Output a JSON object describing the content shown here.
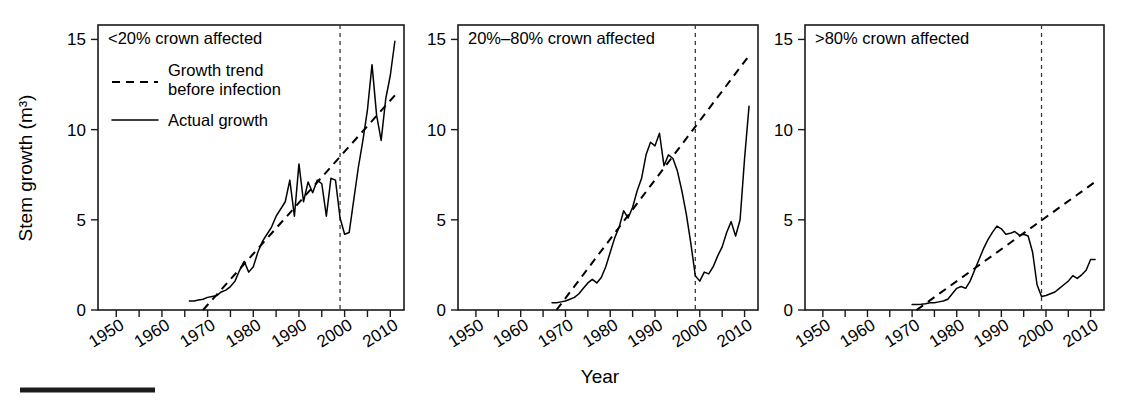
{
  "figure": {
    "width": 1129,
    "height": 404,
    "background": "#ffffff",
    "ylabel": "Stem growth (m³)",
    "xlabel": "Year",
    "footer_rule": true
  },
  "legend": {
    "position": "inside-panel-1-top-left",
    "entries": [
      {
        "style": "dashed",
        "label_line1": "Growth trend",
        "label_line2": "before infection"
      },
      {
        "style": "solid",
        "label_line1": "Actual growth",
        "label_line2": ""
      }
    ]
  },
  "chart_data": [
    {
      "type": "line",
      "title": "<20% crown affected",
      "panel_index": 0,
      "xlabel": "Year",
      "ylabel": "Stem growth (m³)",
      "xlim": [
        1946,
        2013
      ],
      "ylim": [
        0,
        15.8
      ],
      "yticks": [
        0,
        5,
        10,
        15
      ],
      "xticks_major": [
        1950,
        1960,
        1970,
        1980,
        1990,
        2000,
        2010
      ],
      "xticks_minor": [
        1955,
        1965,
        1975,
        1985,
        1995,
        2005
      ],
      "grid": false,
      "infection_year": 1999,
      "annotations": [
        {
          "type": "vline",
          "x": 1999,
          "style": "dashed"
        }
      ],
      "series": [
        {
          "name": "Actual growth",
          "style": "solid",
          "x": [
            1966,
            1967,
            1968,
            1969,
            1970,
            1971,
            1972,
            1973,
            1974,
            1975,
            1976,
            1977,
            1978,
            1979,
            1980,
            1981,
            1982,
            1983,
            1984,
            1985,
            1986,
            1987,
            1988,
            1989,
            1990,
            1991,
            1992,
            1993,
            1994,
            1995,
            1996,
            1997,
            1998,
            1999,
            2000,
            2001,
            2002,
            2003,
            2004,
            2005,
            2006,
            2007,
            2008,
            2009,
            2010,
            2011
          ],
          "values": [
            0.5,
            0.5,
            0.55,
            0.6,
            0.7,
            0.75,
            0.8,
            1.0,
            1.1,
            1.3,
            1.6,
            2.2,
            2.7,
            2.1,
            2.4,
            3.2,
            3.8,
            4.2,
            4.6,
            5.2,
            5.6,
            6.0,
            7.2,
            5.2,
            8.1,
            6.0,
            7.1,
            6.5,
            7.2,
            7.0,
            5.2,
            7.3,
            7.2,
            5.1,
            4.2,
            4.3,
            6.1,
            7.9,
            9.4,
            11.1,
            13.6,
            10.8,
            9.4,
            11.7,
            13.0,
            14.9
          ]
        },
        {
          "name": "Growth trend before infection",
          "style": "dashed",
          "x": [
            1969,
            2011
          ],
          "values": [
            0.0,
            11.9
          ]
        }
      ]
    },
    {
      "type": "line",
      "title": "20%–80% crown affected",
      "panel_index": 1,
      "xlabel": "Year",
      "ylabel": "Stem growth (m³)",
      "xlim": [
        1946,
        2013
      ],
      "ylim": [
        0,
        15.8
      ],
      "yticks": [
        0,
        5,
        10,
        15
      ],
      "xticks_major": [
        1950,
        1960,
        1970,
        1980,
        1990,
        2000,
        2010
      ],
      "xticks_minor": [
        1955,
        1965,
        1975,
        1985,
        1995,
        2005
      ],
      "grid": false,
      "infection_year": 1999,
      "annotations": [
        {
          "type": "vline",
          "x": 1999,
          "style": "dashed"
        }
      ],
      "series": [
        {
          "name": "Actual growth",
          "style": "solid",
          "x": [
            1967,
            1968,
            1969,
            1970,
            1971,
            1972,
            1973,
            1974,
            1975,
            1976,
            1977,
            1978,
            1979,
            1980,
            1981,
            1982,
            1983,
            1984,
            1985,
            1986,
            1987,
            1988,
            1989,
            1990,
            1991,
            1992,
            1993,
            1994,
            1995,
            1996,
            1997,
            1998,
            1999,
            2000,
            2001,
            2002,
            2003,
            2004,
            2005,
            2006,
            2007,
            2008,
            2009,
            2010,
            2011
          ],
          "values": [
            0.4,
            0.4,
            0.45,
            0.5,
            0.6,
            0.7,
            0.9,
            1.2,
            1.5,
            1.7,
            1.5,
            1.8,
            2.4,
            3.2,
            4.0,
            4.6,
            5.5,
            5.1,
            5.7,
            6.6,
            7.3,
            8.6,
            9.3,
            9.1,
            9.8,
            8.0,
            8.6,
            8.4,
            7.7,
            6.6,
            5.3,
            3.7,
            1.9,
            1.6,
            2.1,
            2.0,
            2.4,
            3.0,
            3.5,
            4.3,
            4.9,
            4.1,
            5.0,
            8.4,
            11.3
          ]
        },
        {
          "name": "Growth trend before infection",
          "style": "dashed",
          "x": [
            1968,
            2011
          ],
          "values": [
            0.0,
            14.1
          ]
        }
      ]
    },
    {
      "type": "line",
      "title": ">80% crown affected",
      "panel_index": 2,
      "xlabel": "Year",
      "ylabel": "Stem growth (m³)",
      "xlim": [
        1946,
        2013
      ],
      "ylim": [
        0,
        15.8
      ],
      "yticks": [
        0,
        5,
        10,
        15
      ],
      "xticks_major": [
        1950,
        1960,
        1970,
        1980,
        1990,
        2000,
        2010
      ],
      "xticks_minor": [
        1955,
        1965,
        1975,
        1985,
        1995,
        2005
      ],
      "grid": false,
      "infection_year": 1999,
      "annotations": [
        {
          "type": "vline",
          "x": 1999,
          "style": "dashed"
        }
      ],
      "series": [
        {
          "name": "Actual growth",
          "style": "solid",
          "x": [
            1970,
            1971,
            1972,
            1973,
            1974,
            1975,
            1976,
            1977,
            1978,
            1979,
            1980,
            1981,
            1982,
            1983,
            1984,
            1985,
            1986,
            1987,
            1988,
            1989,
            1990,
            1991,
            1992,
            1993,
            1994,
            1995,
            1996,
            1997,
            1998,
            1999,
            2000,
            2001,
            2002,
            2003,
            2004,
            2005,
            2006,
            2007,
            2008,
            2009,
            2010,
            2011
          ],
          "values": [
            0.3,
            0.3,
            0.32,
            0.35,
            0.4,
            0.4,
            0.45,
            0.5,
            0.6,
            0.9,
            1.2,
            1.3,
            1.2,
            1.6,
            2.2,
            2.8,
            3.4,
            3.9,
            4.3,
            4.65,
            4.5,
            4.2,
            4.25,
            4.35,
            4.15,
            4.2,
            4.1,
            3.2,
            1.4,
            0.75,
            0.8,
            0.9,
            1.0,
            1.2,
            1.4,
            1.6,
            1.9,
            1.75,
            1.95,
            2.2,
            2.8,
            2.8
          ]
        },
        {
          "name": "Growth trend before infection",
          "style": "dashed",
          "x": [
            1971,
            2011
          ],
          "values": [
            0.0,
            7.1
          ]
        }
      ]
    }
  ]
}
